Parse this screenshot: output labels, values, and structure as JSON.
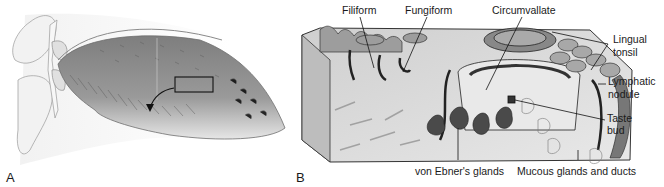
{
  "figure": {
    "panel_a": {
      "letter": "A",
      "description": "Sagittal view of tongue with highlighted inset region"
    },
    "panel_b": {
      "letter": "B",
      "labels": {
        "filiform": "Filiform",
        "fungiform": "Fungiform",
        "circumvallate": "Circumvallate",
        "lingual_tonsil_1": "Lingual",
        "lingual_tonsil_2": "tonsil",
        "lymphatic_nodule_1": "Lymphatic",
        "lymphatic_nodule_2": "nodule",
        "taste_bud_1": "Taste",
        "taste_bud_2": "bud",
        "von_ebner": "von Ebner's glands",
        "mucous_glands": "Mucous glands and ducts"
      }
    },
    "colors": {
      "tongue_fill": "#8f8f8f",
      "tongue_light": "#d8d8d8",
      "bone_fill": "#eeeeee",
      "outline": "#555555",
      "label_text": "#1a1a1a",
      "block_fill": "#d9d9d9",
      "block_dark": "#3a3a3a"
    }
  }
}
